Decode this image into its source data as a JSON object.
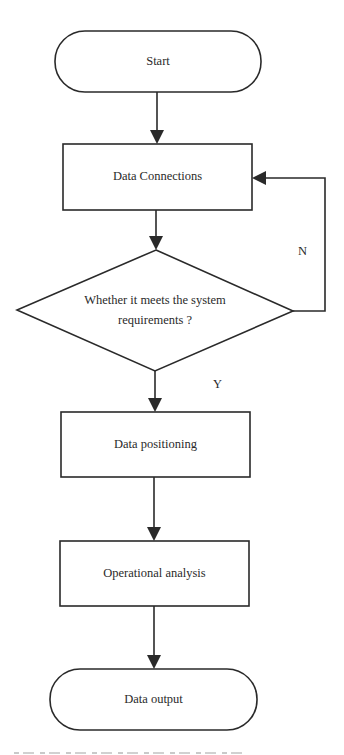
{
  "diagram": {
    "type": "flowchart",
    "nodes": {
      "start": {
        "shape": "terminal",
        "label": "Start"
      },
      "data_connections": {
        "shape": "process",
        "label": "Data Connections"
      },
      "decision": {
        "shape": "decision",
        "line1": "Whether it meets the system",
        "line2": "requirements ?"
      },
      "data_positioning": {
        "shape": "process",
        "label": "Data positioning"
      },
      "operational_analysis": {
        "shape": "process",
        "label": "Operational analysis"
      },
      "data_output": {
        "shape": "terminal",
        "label": "Data output"
      }
    },
    "edges": {
      "no_label": "N",
      "yes_label": "Y"
    },
    "edge_list": [
      {
        "from": "Start",
        "to": "Data Connections"
      },
      {
        "from": "Data Connections",
        "to": "Whether it meets the system requirements ?"
      },
      {
        "from": "Whether it meets the system requirements ?",
        "to": "Data Connections",
        "label": "N"
      },
      {
        "from": "Whether it meets the system requirements ?",
        "to": "Data positioning",
        "label": "Y"
      },
      {
        "from": "Data positioning",
        "to": "Operational analysis"
      },
      {
        "from": "Operational analysis",
        "to": "Data output"
      }
    ],
    "colors": {
      "stroke": "#2a2a2a",
      "fill": "#ffffff",
      "background": "#ffffff"
    }
  }
}
